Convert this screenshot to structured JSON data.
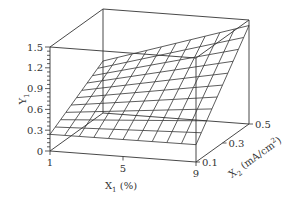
{
  "chart_data": {
    "type": "surface3d",
    "title": "",
    "xlabel": "X1 (%)",
    "ylabel": "X2 (mA/cm²)",
    "zlabel": "Y1",
    "x_ticks": [
      "1",
      "5",
      "9"
    ],
    "y_ticks": [
      "0.1",
      "0.3",
      "0.5"
    ],
    "z_ticks": [
      "0",
      "0.3",
      "0.6",
      "0.9",
      "1.2",
      "1.5"
    ],
    "xlim": [
      1,
      9
    ],
    "ylim": [
      0.1,
      0.5
    ],
    "zlim": [
      0,
      1.5
    ],
    "grid_divisions": 10,
    "surface_corners": [
      {
        "x1": 1,
        "x2": 0.1,
        "y1": 0.24
      },
      {
        "x1": 9,
        "x2": 0.1,
        "y1": 0.25
      },
      {
        "x1": 1,
        "x2": 0.5,
        "y1": 0.75
      },
      {
        "x1": 9,
        "x2": 0.5,
        "y1": 1.42
      }
    ]
  },
  "labels": {
    "z_axis": "Y",
    "z_sub": "1",
    "x_axis": "X",
    "x_sub": "1",
    "x_unit": " (%)",
    "y_axis": "X",
    "y_sub": "2",
    "y_unit": " (mA/cm",
    "y_sup": "2",
    "y_close": ")"
  },
  "colors": {
    "line": "#333333",
    "background": "#ffffff"
  }
}
